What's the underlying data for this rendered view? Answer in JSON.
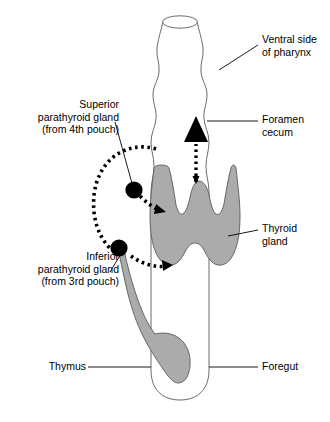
{
  "figure": {
    "colors": {
      "gland_fill": "#ababab",
      "outline": "#555555",
      "marker": "#000000",
      "text": "#000000",
      "background": "#ffffff"
    }
  },
  "labels": {
    "ventral_side": "Ventral side\nof pharynx",
    "foramen_cecum": "Foramen\ncecum",
    "thyroid_gland": "Thyroid\ngland",
    "foregut": "Foregut",
    "superior_parathyroid": "Superior\nparathyroid gland\n(from 4th pouch)",
    "inferior_parathyroid": "Inferior\nparathyroid gland\n(from 3rd pouch)",
    "thymus": "Thymus"
  },
  "structures": {
    "pharynx_tube": "foregut-pharynx-tube",
    "thyroid": "thyroid-gland-shape",
    "thymus": "thymus-shape",
    "superior_parathyroid_marker": "superior-parathyroid-dot",
    "inferior_parathyroid_marker": "inferior-parathyroid-dot",
    "foramen_cecum_arrow": "foramen-cecum-arrow",
    "superior_migration_path": "superior-parathyroid-migration-arrow",
    "inferior_migration_path": "inferior-parathyroid-migration-arrow",
    "descent_path": "thyroid-descent-dotted-arrow"
  }
}
